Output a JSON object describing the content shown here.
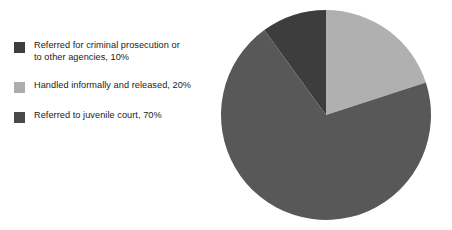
{
  "chart_data": {
    "type": "pie",
    "title": "",
    "subtitle": "",
    "xlabel": "",
    "ylabel": "",
    "grid": false,
    "legend_position": "left",
    "start_angle_deg": 0,
    "direction": "clockwise",
    "categories": [
      "Referred for criminal prosecution or to other agencies",
      "Handled informally and released",
      "Referred to juvenile court"
    ],
    "values": [
      10,
      20,
      70
    ],
    "value_unit": "%",
    "colors": [
      "#3d3d3d",
      "#b0b0b0",
      "#585858"
    ],
    "slices": [
      {
        "label": "Referred for criminal prosecution or to other agencies",
        "value": 10,
        "value_text": "10%",
        "color": "#3d3d3d",
        "start_deg": 324,
        "end_deg": 360
      },
      {
        "label": "Handled informally and released",
        "value": 20,
        "value_text": "20%",
        "color": "#b0b0b0",
        "start_deg": 0,
        "end_deg": 72
      },
      {
        "label": "Referred to juvenile court",
        "value": 70,
        "value_text": "70%",
        "color": "#585858",
        "start_deg": 72,
        "end_deg": 324
      }
    ]
  },
  "legend": {
    "items": [
      {
        "label": "Referred for criminal prosecution or\nto other agencies, 10%",
        "color": "#3d3d3d",
        "swatch_name": "legend-swatch-criminal-prosecution"
      },
      {
        "label": "Handled informally and released, 20%",
        "color": "#adadad",
        "swatch_name": "legend-swatch-handled-informally"
      },
      {
        "label": "Referred to juvenile court, 70%",
        "color": "#4a4a4a",
        "swatch_name": "legend-swatch-juvenile-court"
      }
    ]
  },
  "pie": {
    "center_x": 107,
    "center_y": 111,
    "radius": 105
  }
}
